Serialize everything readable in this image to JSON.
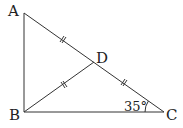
{
  "diagram": {
    "points": {
      "A": {
        "label": "A",
        "x": 24,
        "y": 13
      },
      "B": {
        "label": "B",
        "x": 24,
        "y": 112
      },
      "C": {
        "label": "C",
        "x": 164,
        "y": 112
      },
      "D": {
        "label": "D",
        "x": 94,
        "y": 62
      }
    },
    "angle_label": "35°",
    "segments": [
      "AB",
      "BC",
      "AC",
      "BD"
    ],
    "equal_marks": [
      "AD",
      "DC",
      "BD"
    ],
    "stroke_color": "#333333"
  }
}
